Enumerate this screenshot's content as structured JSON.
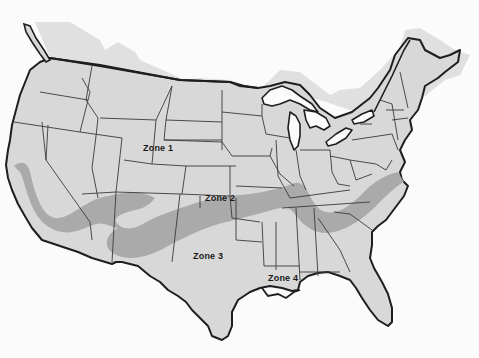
{
  "map": {
    "subject": "Contiguous United States zone map",
    "colors": {
      "background": "#fbfbfb",
      "land": "#d9d9d9",
      "canada_land": "#dedede",
      "band": "#a6a6a6",
      "coast": "#1e1e1e",
      "state_border": "#3a3a3a",
      "water": "#fbfbfb"
    },
    "zones": [
      {
        "id": "zone1",
        "label": "Zone 1",
        "x": 143,
        "y": 148
      },
      {
        "id": "zone2",
        "label": "Zone 2",
        "x": 205,
        "y": 198
      },
      {
        "id": "zone3",
        "label": "Zone 3",
        "x": 193,
        "y": 254
      },
      {
        "id": "zone4",
        "label": "Zone 4",
        "x": 268,
        "y": 276
      }
    ]
  }
}
